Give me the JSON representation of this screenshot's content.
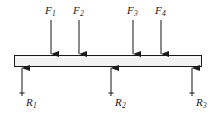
{
  "figure": {
    "type": "free-body-diagram",
    "beam": {
      "name": "beam",
      "fill_color": "#f2f2f2",
      "stroke_color": "#1a1a1a",
      "x": 14,
      "y": 55,
      "width": 188,
      "height": 12
    },
    "colors": {
      "arrow": "#1a1a1a",
      "shaft": "#2b2b2b",
      "text": "#1a1a1a",
      "background": "#ffffff"
    },
    "loads": [
      {
        "id": "F1",
        "letter": "F",
        "subscript": "1",
        "x": 51,
        "tail_y": 20,
        "head_y": 54,
        "direction": "down",
        "label_x": 45,
        "label_y": 5
      },
      {
        "id": "F2",
        "letter": "F",
        "subscript": "2",
        "x": 79,
        "tail_y": 20,
        "head_y": 54,
        "direction": "down",
        "label_x": 73,
        "label_y": 5
      },
      {
        "id": "F3",
        "letter": "F",
        "subscript": "3",
        "x": 133,
        "tail_y": 20,
        "head_y": 54,
        "direction": "down",
        "label_x": 127,
        "label_y": 5
      },
      {
        "id": "F4",
        "letter": "F",
        "subscript": "4",
        "x": 161,
        "tail_y": 20,
        "head_y": 54,
        "direction": "down",
        "label_x": 155,
        "label_y": 5
      }
    ],
    "reactions": [
      {
        "id": "R1",
        "letter": "R",
        "subscript": "1",
        "x": 22,
        "tail_y": 96,
        "head_y": 68,
        "direction": "up",
        "tick_y": 93,
        "label_x": 26,
        "label_y": 97
      },
      {
        "id": "R2",
        "letter": "R",
        "subscript": "2",
        "x": 111,
        "tail_y": 96,
        "head_y": 68,
        "direction": "up",
        "tick_y": 93,
        "label_x": 115,
        "label_y": 97
      },
      {
        "id": "R3",
        "letter": "R",
        "subscript": "3",
        "x": 192,
        "tail_y": 96,
        "head_y": 68,
        "direction": "up",
        "tick_y": 93,
        "label_x": 196,
        "label_y": 97
      }
    ]
  }
}
